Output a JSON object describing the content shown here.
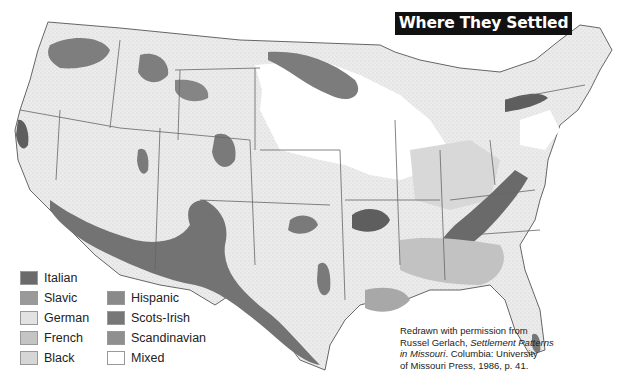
{
  "title": "Where They Settled",
  "legend": {
    "items": [
      {
        "label": "Italian",
        "color": "#6b6b6b"
      },
      {
        "label": "Slavic",
        "color": "#9a9a9a"
      },
      {
        "label": "German",
        "color": "#e2e2e2"
      },
      {
        "label": "French",
        "color": "#c4c4c4"
      },
      {
        "label": "Black",
        "color": "#d6d6d6"
      },
      {
        "label": "Hispanic",
        "color": "#8a8a8a"
      },
      {
        "label": "Scots-Irish",
        "color": "#777777"
      },
      {
        "label": "Scandinavian",
        "color": "#8f8f8f"
      },
      {
        "label": "Mixed",
        "color": "#ffffff"
      }
    ]
  },
  "citation": {
    "line1": "Redrawn with permission from",
    "line2_prefix": "Russel Gerlach, ",
    "line2_italic": "Settlement Patterns",
    "line3_italic": "in Missouri",
    "line3_suffix": ". Columbia: University",
    "line4": "of Missouri Press, 1986, p. 41."
  },
  "map": {
    "subject": "United States ethnic settlement regions",
    "base_color": "#ececec",
    "border_color": "#555555"
  }
}
